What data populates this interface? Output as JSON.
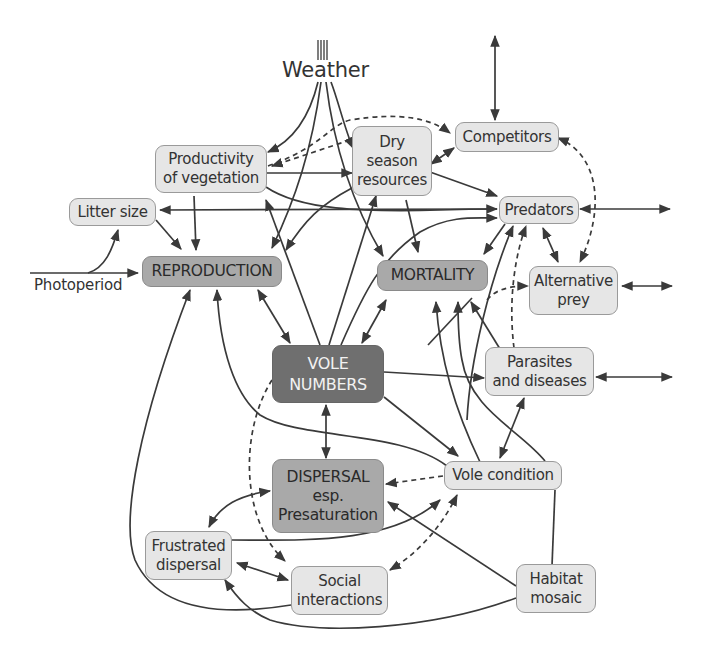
{
  "title_driver": "Weather",
  "external_driver": "Photoperiod",
  "nodes": {
    "competitors": "Competitors",
    "productivity": "Productivity\nof vegetation",
    "dry_season": "Dry\nseason\nresources",
    "litter_size": "Litter size",
    "predators": "Predators",
    "reproduction": "REPRODUCTION",
    "mortality": "MORTALITY",
    "alternative_prey": "Alternative\nprey",
    "vole_numbers": "VOLE\nNUMBERS",
    "parasites": "Parasites\nand diseases",
    "dispersal": "DISPERSAL\nesp.\nPresaturation",
    "vole_condition": "Vole condition",
    "frustrated_dispersal": "Frustrated\ndispersal",
    "social_interactions": "Social\ninteractions",
    "habitat_mosaic": "Habitat\nmosaic"
  },
  "colors": {
    "light_node": "#e6e6e6",
    "mid_node": "#a9a9a9",
    "dark_node": "#6f6f6f",
    "line": "#3a3a3a"
  },
  "legend": {
    "solid_line": "direct effect",
    "dashed_line": "indirect effect"
  }
}
